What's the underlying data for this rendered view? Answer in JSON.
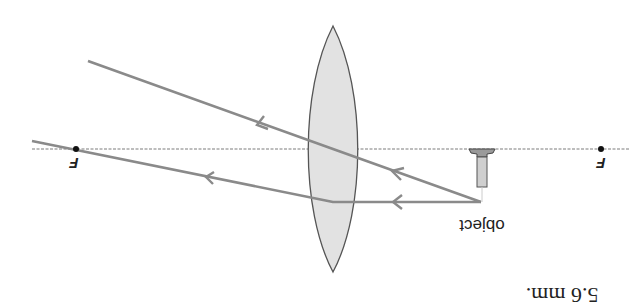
{
  "diagram": {
    "type": "convex lens ray diagram",
    "orientation": "rotated 180 degrees",
    "colors": {
      "ray": "#8a8a8a",
      "axis": "#a8a8a8",
      "lens_fill": "#e2e2e2",
      "lens_stroke": "#555555",
      "focal_point": "#111111",
      "text": "#222222"
    },
    "labels": {
      "focal_left": "F",
      "focal_right": "F",
      "object": "object",
      "caption": "5.6 mm."
    },
    "elements": {
      "principal_axis": "horizontal dashed line",
      "lens": "biconvex lens",
      "object": "small object (pin) below axis",
      "rays": [
        "ray through optical center",
        "ray parallel to axis refracted through focal point"
      ]
    }
  }
}
